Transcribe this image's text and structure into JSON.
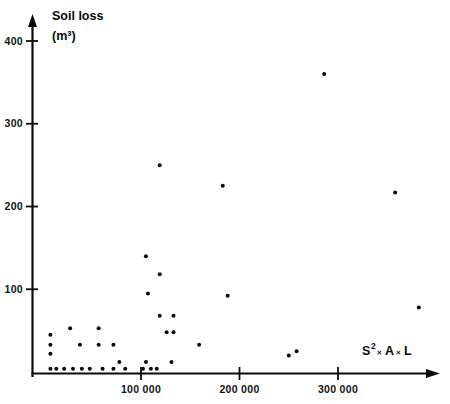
{
  "figure": {
    "background_color": "#ffffff",
    "ink_color": "#0a0a0a",
    "point_color": "#0b0b0b"
  },
  "axes": {
    "y_title_line1": "Soil loss",
    "y_title_line2": "(m³)",
    "x_title_main": "S",
    "x_title_sup": "2",
    "x_title_mult1": "×",
    "x_title_a": "A",
    "x_title_mult2": "×",
    "x_title_l": "L",
    "x_title_full": "S² × A × L",
    "y_ticks": [
      "100",
      "200",
      "300",
      "400"
    ],
    "y_tick_values": [
      100,
      200,
      300,
      400
    ],
    "x_ticks": [
      "100 000",
      "200 000",
      "300 000"
    ],
    "x_tick_values": [
      100000,
      200000,
      300000
    ],
    "y_arrow": "up-arrow",
    "x_arrow": "right-arrow"
  },
  "chart_data": {
    "type": "scatter",
    "title": "",
    "subtitle": "",
    "xlabel": "S² × A × L",
    "ylabel": "Soil loss (m³)",
    "xlim": [
      0,
      410000
    ],
    "ylim": [
      0,
      430
    ],
    "grid": false,
    "legend": false,
    "series": [
      {
        "name": "Soil loss observations",
        "marker": "filled-circle",
        "color": "#0b0b0b",
        "points": [
          {
            "x": 286000,
            "y": 360
          },
          {
            "x": 119000,
            "y": 250
          },
          {
            "x": 183000,
            "y": 225
          },
          {
            "x": 358000,
            "y": 217
          },
          {
            "x": 105000,
            "y": 140
          },
          {
            "x": 119000,
            "y": 118
          },
          {
            "x": 107000,
            "y": 95
          },
          {
            "x": 188000,
            "y": 92
          },
          {
            "x": 382000,
            "y": 78
          },
          {
            "x": 119000,
            "y": 68
          },
          {
            "x": 133000,
            "y": 68
          },
          {
            "x": 28000,
            "y": 53
          },
          {
            "x": 57000,
            "y": 53
          },
          {
            "x": 126000,
            "y": 48
          },
          {
            "x": 133000,
            "y": 48
          },
          {
            "x": 8000,
            "y": 45
          },
          {
            "x": 8000,
            "y": 33
          },
          {
            "x": 38000,
            "y": 33
          },
          {
            "x": 57000,
            "y": 33
          },
          {
            "x": 72000,
            "y": 33
          },
          {
            "x": 159000,
            "y": 33
          },
          {
            "x": 8000,
            "y": 22
          },
          {
            "x": 250000,
            "y": 20
          },
          {
            "x": 258000,
            "y": 25
          },
          {
            "x": 78000,
            "y": 12
          },
          {
            "x": 105000,
            "y": 12
          },
          {
            "x": 131000,
            "y": 12
          },
          {
            "x": 8000,
            "y": 4
          },
          {
            "x": 14000,
            "y": 4
          },
          {
            "x": 22000,
            "y": 4
          },
          {
            "x": 31000,
            "y": 4
          },
          {
            "x": 40000,
            "y": 4
          },
          {
            "x": 48000,
            "y": 4
          },
          {
            "x": 61000,
            "y": 4
          },
          {
            "x": 72000,
            "y": 4
          },
          {
            "x": 84000,
            "y": 4
          },
          {
            "x": 102000,
            "y": 4
          },
          {
            "x": 110000,
            "y": 4
          },
          {
            "x": 116000,
            "y": 4
          }
        ]
      }
    ]
  }
}
